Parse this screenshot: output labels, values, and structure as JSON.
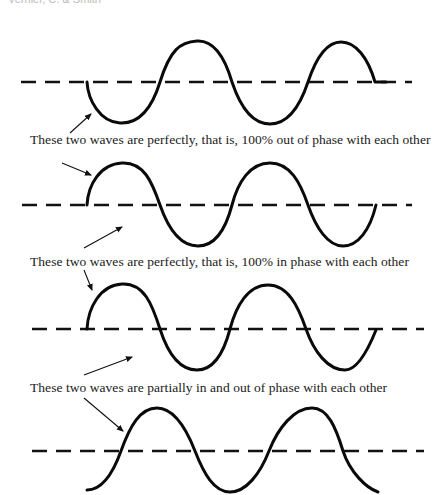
{
  "header": {
    "clipped_text": "Vernier, C. & Smith"
  },
  "captions": [
    {
      "id": "out-of-phase",
      "text": "These two waves are perfectly, that is, 100% out of phase with each other"
    },
    {
      "id": "in-phase",
      "text": "These two waves are perfectly, that is, 100% in phase with each other"
    },
    {
      "id": "partial-phase",
      "text": "These two waves are partially in and out of phase with each other"
    }
  ],
  "waves": [
    {
      "index": 1,
      "start_direction": "down",
      "baseline_y": 82
    },
    {
      "index": 2,
      "start_direction": "up",
      "baseline_y": 205
    },
    {
      "index": 3,
      "start_direction": "up",
      "baseline_y": 329
    },
    {
      "index": 4,
      "start_direction": "up-shifted",
      "baseline_y": 451
    }
  ],
  "colors": {
    "ink": "#0a0a0a",
    "background": "#ffffff"
  }
}
